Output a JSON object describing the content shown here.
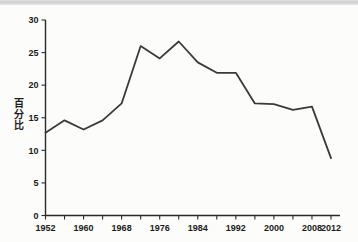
{
  "chart_data": {
    "type": "line",
    "title": "",
    "xlabel": "",
    "ylabel": "百分比",
    "ylabel_chars": [
      "百",
      "分",
      "比"
    ],
    "x": [
      1952,
      1956,
      1960,
      1964,
      1968,
      1972,
      1976,
      1980,
      1984,
      1988,
      1992,
      1996,
      2000,
      2004,
      2008,
      2012
    ],
    "values": [
      12.7,
      14.6,
      13.2,
      14.6,
      17.2,
      26.0,
      24.1,
      26.7,
      23.5,
      21.9,
      21.9,
      17.2,
      17.1,
      16.2,
      16.7,
      8.8
    ],
    "series": [
      {
        "name": "百分比",
        "values": [
          12.7,
          14.6,
          13.2,
          14.6,
          17.2,
          26.0,
          24.1,
          26.7,
          23.5,
          21.9,
          21.9,
          17.2,
          17.1,
          16.2,
          16.7,
          8.8
        ]
      }
    ],
    "xlim": [
      1952,
      2012
    ],
    "ylim": [
      0,
      30
    ],
    "x_tick_values": [
      1952,
      1956,
      1960,
      1964,
      1968,
      1972,
      1976,
      1980,
      1984,
      1988,
      1992,
      1996,
      2000,
      2004,
      2008,
      2012
    ],
    "x_tick_labels": [
      "1952",
      "",
      "1960",
      "",
      "1968",
      "",
      "1976",
      "",
      "1984",
      "",
      "1992",
      "",
      "2000",
      "",
      "2008",
      "2012"
    ],
    "y_ticks": [
      0,
      5,
      10,
      15,
      20,
      25,
      30
    ],
    "y_tick_labels": [
      "0",
      "5",
      "10",
      "15",
      "20",
      "25",
      "30"
    ],
    "grid": false,
    "legend": "none",
    "line_color": "#3a3a3a",
    "axis_color": "#2a2a2a",
    "background_color": "#fcfcfa"
  }
}
